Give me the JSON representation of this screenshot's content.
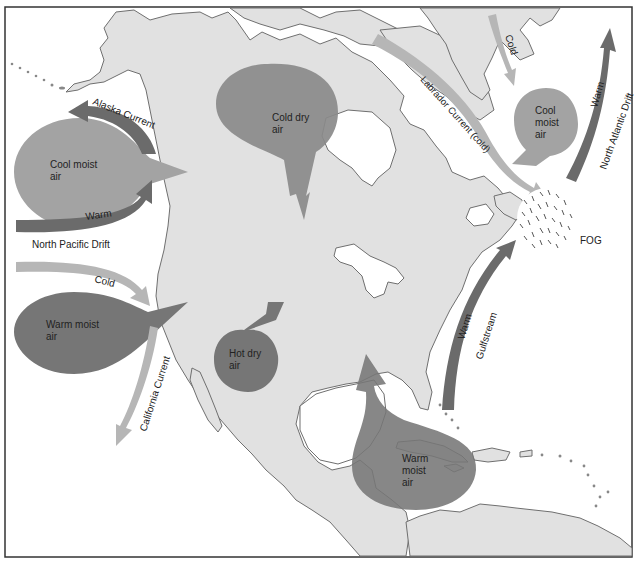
{
  "figure": {
    "colors": {
      "land": "#e1e1e1",
      "water": "#ffffff",
      "coastline": "#6f6f6f",
      "cold_current": "#b6b6b6",
      "warm_current": "#6b6b6b",
      "cool_air_mass": "#a3a3a3",
      "warm_air_mass": "#767676",
      "cold_dry_air_mass": "#8a8a8a",
      "border": "#333333"
    }
  },
  "air_masses": [
    {
      "id": "cool-moist-pacific",
      "line1": "Cool moist",
      "line2": "air",
      "type": "cool"
    },
    {
      "id": "warm-moist-pacific",
      "line1": "Warm moist",
      "line2": "air",
      "type": "warm"
    },
    {
      "id": "cold-dry-arctic",
      "line1": "Cold dry",
      "line2": "air",
      "type": "cold"
    },
    {
      "id": "cool-moist-atlantic",
      "line1": "Cool",
      "line2": "moist",
      "line3": "air",
      "type": "cool"
    },
    {
      "id": "hot-dry",
      "line1": "Hot dry",
      "line2": "air",
      "type": "warm"
    },
    {
      "id": "warm-moist-gulf",
      "line1": "Warm",
      "line2": "moist",
      "line3": "air",
      "type": "warm"
    }
  ],
  "currents": {
    "alaska": {
      "label": "Alaska Current",
      "temp": ""
    },
    "north_pacific": {
      "label": "North Pacific Drift",
      "temp": "Warm"
    },
    "cold_pacific": {
      "temp": "Cold"
    },
    "california": {
      "label": "California Current"
    },
    "labrador": {
      "label": "Labrador Current (cold)"
    },
    "greenland": {
      "temp": "Cold"
    },
    "north_atlantic": {
      "label": "North Atlantic Drift",
      "temp": "Warm"
    },
    "gulfstream": {
      "label": "Gulfstream",
      "temp": "Warm"
    }
  },
  "fog": {
    "label": "FOG"
  }
}
